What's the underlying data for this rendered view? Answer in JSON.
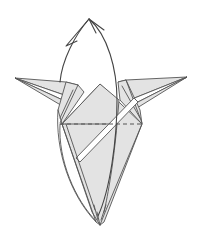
{
  "diagram": {
    "paper_color": "#e3e3e3",
    "line_color": "#555555",
    "background": "#ffffff",
    "elements": {
      "valley_fold_line": {
        "style": "dashed",
        "orientation": "horizontal",
        "y": 124,
        "x_start": 60,
        "x_end": 142
      },
      "fold_arrow": {
        "direction": "up",
        "tip": [
          89,
          19
        ],
        "meaning": "fold front flap upward"
      },
      "left_wing": {
        "tip": [
          15,
          78
        ]
      },
      "right_wing": {
        "tip": [
          187,
          77
        ]
      },
      "center_peak": [
        100,
        84
      ],
      "bottom_point": [
        100,
        225
      ]
    }
  }
}
